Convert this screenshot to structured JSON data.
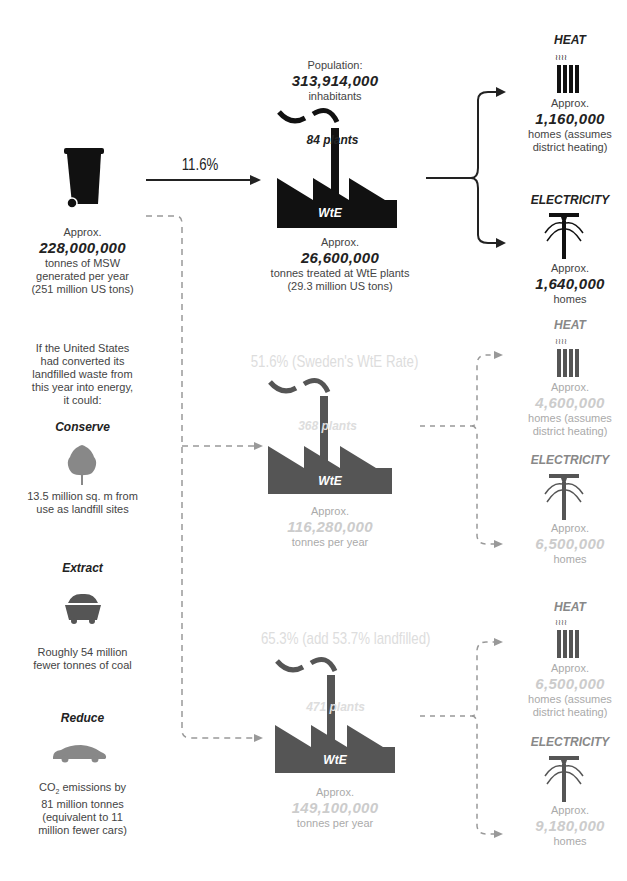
{
  "source": {
    "label": "Approx.",
    "value": "228,000,000",
    "line1": "tonnes of MSW",
    "line2": "generated per year",
    "line3": "(251 million US tons)",
    "icon": "trash-bin-icon"
  },
  "current": {
    "rate": "11.6%",
    "population_label": "Population:",
    "population": "313,914,000",
    "population_unit": "inhabitants",
    "plants": "84 plants",
    "plant_text": "WtE",
    "approx": "Approx.",
    "tonnes": "26,600,000",
    "tonnes_line1": "tonnes treated at WtE plants",
    "tonnes_line2": "(29.3 million US tons)",
    "heat": {
      "title": "HEAT",
      "approx": "Approx.",
      "value": "1,160,000",
      "line1": "homes (assumes",
      "line2": "district heating)"
    },
    "electricity": {
      "title": "ELECTRICITY",
      "approx": "Approx.",
      "value": "1,640,000",
      "line1": "homes"
    }
  },
  "intro": {
    "lines": [
      "If the United States",
      "had converted its",
      "landfilled waste from",
      "this year into energy,",
      "it could:"
    ]
  },
  "benefits": [
    {
      "title": "Conserve",
      "icon": "tree-icon",
      "lines": [
        "13.5 million sq. m from",
        "use as landfill sites"
      ]
    },
    {
      "title": "Extract",
      "icon": "coal-cart-icon",
      "lines": [
        "Roughly 54 million",
        "fewer tonnes of coal"
      ]
    },
    {
      "title": "Reduce",
      "icon": "car-icon",
      "co2_prefix": "CO",
      "co2_sub": "2",
      "co2_suffix": " emissions by",
      "lines": [
        "81 million tonnes",
        "(equivalent to 11",
        "million fewer cars)"
      ]
    }
  ],
  "scenario_sweden": {
    "rate": "51.6% (Sweden's WtE Rate)",
    "plants": "368 plants",
    "plant_text": "WtE",
    "approx": "Approx.",
    "tonnes": "116,280,000",
    "tonnes_unit": "tonnes per year",
    "heat": {
      "title": "HEAT",
      "approx": "Approx.",
      "value": "4,600,000",
      "line1": "homes (assumes",
      "line2": "district heating)"
    },
    "electricity": {
      "title": "ELECTRICITY",
      "approx": "Approx.",
      "value": "6,500,000",
      "line1": "homes"
    }
  },
  "scenario_full": {
    "rate": "65.3% (add 53.7% landfilled)",
    "plants": "471 plants",
    "plant_text": "WtE",
    "approx": "Approx.",
    "tonnes": "149,100,000",
    "tonnes_unit": "tonnes per year",
    "heat": {
      "title": "HEAT",
      "approx": "Approx.",
      "value": "6,500,000",
      "line1": "homes (assumes",
      "line2": "district heating)"
    },
    "electricity": {
      "title": "ELECTRICITY",
      "approx": "Approx.",
      "value": "9,180,000",
      "line1": "homes"
    }
  },
  "colors": {
    "dark": "#111111",
    "gray": "#555555",
    "light_text": "#cccccc",
    "dashed": "#999999"
  }
}
